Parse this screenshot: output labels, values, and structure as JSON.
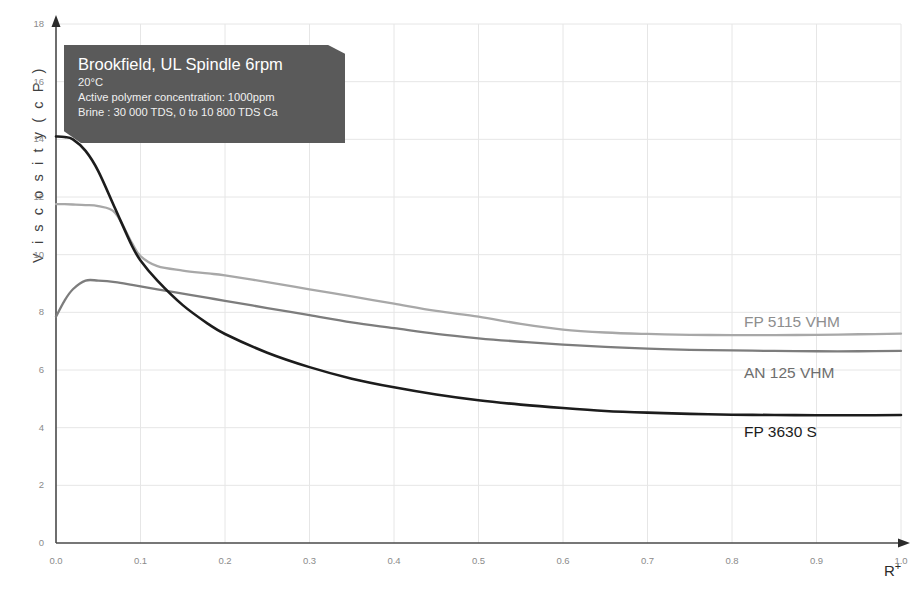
{
  "chart_data": {
    "type": "line",
    "title": "",
    "xlabel": "R+",
    "ylabel": "Viscosity (cP)",
    "xlim": [
      0.0,
      1.0
    ],
    "ylim": [
      0,
      18
    ],
    "grid": true,
    "legend_position": "inline-right",
    "x_ticks": [
      "0.0",
      "0.1",
      "0.2",
      "0.3",
      "0.4",
      "0.5",
      "0.6",
      "0.7",
      "0.8",
      "0.9",
      "1.0"
    ],
    "y_ticks": [
      "0",
      "2",
      "4",
      "6",
      "8",
      "10",
      "12",
      "14",
      "16",
      "18"
    ],
    "x": [
      0.0,
      0.01,
      0.02,
      0.035,
      0.05,
      0.07,
      0.09,
      0.1,
      0.12,
      0.15,
      0.18,
      0.2,
      0.25,
      0.3,
      0.35,
      0.4,
      0.45,
      0.5,
      0.55,
      0.6,
      0.65,
      0.7,
      0.75,
      0.8,
      0.85,
      0.9,
      0.95,
      1.0
    ],
    "series": [
      {
        "name": "FP 5115 VHM",
        "color": "#a8a8a8",
        "values": [
          11.75,
          11.75,
          11.74,
          11.72,
          11.68,
          11.45,
          10.4,
          9.95,
          9.6,
          9.45,
          9.35,
          9.28,
          9.05,
          8.8,
          8.55,
          8.3,
          8.05,
          7.85,
          7.6,
          7.4,
          7.3,
          7.25,
          7.22,
          7.21,
          7.21,
          7.22,
          7.24,
          7.26
        ]
      },
      {
        "name": "AN 125 VHM",
        "color": "#7d7d7d",
        "values": [
          7.85,
          8.4,
          8.8,
          9.1,
          9.1,
          9.05,
          8.95,
          8.9,
          8.8,
          8.65,
          8.5,
          8.4,
          8.15,
          7.9,
          7.65,
          7.45,
          7.25,
          7.1,
          6.98,
          6.88,
          6.8,
          6.74,
          6.7,
          6.68,
          6.66,
          6.65,
          6.65,
          6.66
        ]
      },
      {
        "name": "FP 3630 S",
        "color": "#1c1c1c",
        "values": [
          14.1,
          14.08,
          14.0,
          13.6,
          12.9,
          11.6,
          10.3,
          9.8,
          9.1,
          8.25,
          7.6,
          7.25,
          6.6,
          6.1,
          5.7,
          5.4,
          5.15,
          4.95,
          4.8,
          4.68,
          4.58,
          4.52,
          4.48,
          4.45,
          4.44,
          4.43,
          4.43,
          4.44
        ]
      }
    ]
  },
  "annotation": {
    "title": "Brookfield, UL Spindle 6rpm",
    "line1": "20°C",
    "line2": "Active polymer concentration: 1000ppm",
    "line3": "Brine : 30 000 TDS, 0 to 10 800 TDS Ca",
    "background_color": "#5a5a5a"
  },
  "axis": {
    "y_title": "V i s c o s i t y   ( c P )",
    "x_title": "R",
    "x_title_sup": "+"
  }
}
